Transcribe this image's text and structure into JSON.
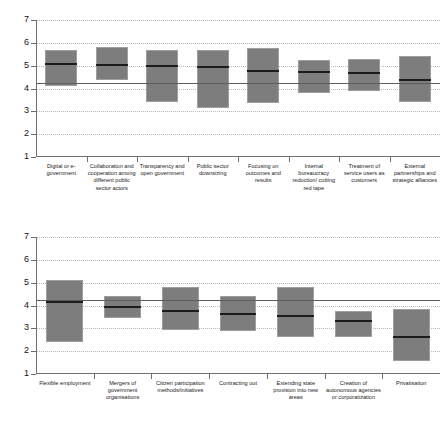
{
  "chart_data": [
    {
      "id": "top",
      "type": "bar",
      "title": "",
      "subtitle": "",
      "xlabel": "",
      "ylabel": "",
      "ylim": [
        1,
        7
      ],
      "yticks": [
        1,
        2,
        3,
        4,
        5,
        6,
        7
      ],
      "ytick_labels": [
        "1",
        "2",
        "3",
        "4",
        "5",
        "6",
        "7"
      ],
      "grid": true,
      "legend": "none",
      "reference_line": 4.25,
      "notes": "Grey box spans lower-to-upper range; dark horizontal rule inside each box is the mean/median value. Horizontal reference line across plot at 4.25.",
      "categories": [
        "Digital or e-government",
        "Collaboration and cooperation among different public sector actors",
        "Transparency and open government",
        "Public sector downsizing",
        "Focusing on outcomes and results",
        "Internal bureaucracy reduction/ cutting red tape",
        "Treatment of service users as customers",
        "External partnerships and strategic alliances"
      ],
      "series": [
        {
          "name": "box_low",
          "values": [
            4.1,
            4.35,
            3.43,
            3.15,
            3.38,
            3.8,
            3.87,
            3.4
          ]
        },
        {
          "name": "box_high",
          "values": [
            5.7,
            5.83,
            5.67,
            5.68,
            5.77,
            5.26,
            5.3,
            5.42
          ]
        },
        {
          "name": "median",
          "values": [
            5.13,
            5.09,
            5.05,
            4.99,
            4.83,
            4.78,
            4.73,
            4.41
          ]
        }
      ]
    },
    {
      "id": "bottom",
      "type": "bar",
      "title": "",
      "subtitle": "",
      "xlabel": "",
      "ylabel": "",
      "ylim": [
        1,
        7
      ],
      "yticks": [
        1,
        2,
        3,
        4,
        5,
        6,
        7
      ],
      "ytick_labels": [
        "1",
        "2",
        "3",
        "4",
        "5",
        "6",
        "7"
      ],
      "grid": true,
      "legend": "none",
      "reference_line": 4.25,
      "notes": "Grey box spans lower-to-upper range; dark horizontal rule inside each box is the mean/median value. Horizontal reference line across plot at 4.25.",
      "categories": [
        "Flexible employment",
        "Mergers of government organisations",
        "Citizen participation methods/initiatives",
        "Contracting out",
        "Extending state provision into new areas",
        "Creation of autonomous agencies or corporatization",
        "Privatisation"
      ],
      "series": [
        {
          "name": "box_low",
          "values": [
            2.41,
            3.45,
            2.91,
            2.89,
            2.6,
            2.6,
            1.57
          ]
        },
        {
          "name": "box_high",
          "values": [
            5.11,
            4.4,
            4.79,
            4.4,
            4.82,
            3.74,
            3.84
          ]
        },
        {
          "name": "median",
          "values": [
            4.19,
            3.98,
            3.82,
            3.68,
            3.58,
            3.36,
            2.66
          ]
        }
      ]
    }
  ],
  "colors": {
    "box_fill": "#7d7d7d",
    "box_edge": "#9e9e9e",
    "median_line": "#1c1c1c",
    "reference_line": "#5d5d5d",
    "axis": "#6f6f6f",
    "gridline": "#b9b9b9",
    "background": "#ffffff",
    "text": "#1a1a1a"
  }
}
